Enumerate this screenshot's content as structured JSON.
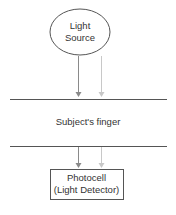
{
  "diagram": {
    "light_source": {
      "line1": "Light",
      "line2": "Source"
    },
    "finger_label": "Subject's finger",
    "detector": {
      "line1": "Photocell",
      "line2": "(Light Detector)"
    },
    "colors": {
      "outline": "#555555",
      "arrow_dark": "#8a8a8a",
      "arrow_light": "#c8c8c8",
      "background": "#ffffff"
    }
  }
}
